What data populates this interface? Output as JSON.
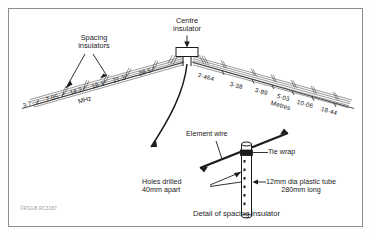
{
  "figure": {
    "credit": "©RSGB RC3187",
    "caption": "Detail of spacing insulator"
  },
  "antenna": {
    "callouts": {
      "spacing_insulators": "Spacing\ninsulators",
      "centre_insulator": "Centre\ninsulator"
    },
    "left_arm": {
      "unit_label": "MHz",
      "ticks": [
        {
          "label": "3·7"
        },
        {
          "label": "7·05"
        },
        {
          "label": "14·2"
        },
        {
          "label": "18·1"
        },
        {
          "label": "21·2"
        },
        {
          "label": "28·5"
        }
      ]
    },
    "right_arm": {
      "unit_label": "Metres",
      "ticks": [
        {
          "label": "2·464"
        },
        {
          "label": "3·38"
        },
        {
          "label": "3·89"
        },
        {
          "label": "5·03"
        },
        {
          "label": "10·06"
        },
        {
          "label": "18·44"
        }
      ]
    }
  },
  "detail": {
    "element_wire": "Element wire",
    "tie_wrap": "Tie wrap",
    "holes_drilled": "Holes drilled\n40mm apart",
    "tube_spec": "12mm dia plastic tube\n280mm long"
  },
  "colors": {
    "ink": "#1b1b1b",
    "border": "#8d8d8d",
    "paper": "#ffffff",
    "credit": "#9a9a9a"
  }
}
